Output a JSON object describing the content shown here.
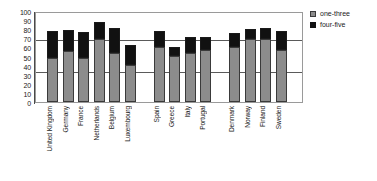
{
  "chart_data": {
    "type": "bar",
    "title": "",
    "subtitle": "",
    "xlabel": "",
    "ylabel": "",
    "ylim": [
      0,
      100
    ],
    "yticks": [
      0,
      10,
      20,
      30,
      40,
      50,
      60,
      70,
      80,
      90,
      100
    ],
    "grid": false,
    "stacked": true,
    "legend_position": "top-right",
    "categories": [
      "United Kingdom",
      "Germany",
      "France",
      "Netherlands",
      "Belgium",
      "Luxembourg",
      "Spain",
      "Greece",
      "Italy",
      "Portugal",
      "Denmark",
      "Norway",
      "Finland",
      "Sweden"
    ],
    "group_breaks_after": [
      "Luxembourg",
      "Portugal"
    ],
    "series": [
      {
        "name": "one-three",
        "color": "#8c8c8c",
        "values": [
          48,
          56,
          48,
          69,
          54,
          41,
          60,
          51,
          54,
          57,
          61,
          69,
          69,
          57
        ]
      },
      {
        "name": "four-five",
        "color": "#111111",
        "values": [
          30,
          23,
          29,
          19,
          27,
          22,
          18,
          10,
          18,
          14,
          15,
          11,
          12,
          21
        ]
      }
    ],
    "totals": [
      78,
      79,
      77,
      88,
      81,
      63,
      78,
      61,
      72,
      71,
      76,
      80,
      81,
      78
    ],
    "reference_lines": [
      {
        "value": 67,
        "color": "#5a5a5a"
      },
      {
        "value": 32,
        "color": "#5a5a5a"
      }
    ]
  },
  "legend": {
    "items": [
      {
        "label": "one-three",
        "swatch": "gray-square-icon"
      },
      {
        "label": "four-five",
        "swatch": "black-square-icon"
      }
    ]
  }
}
